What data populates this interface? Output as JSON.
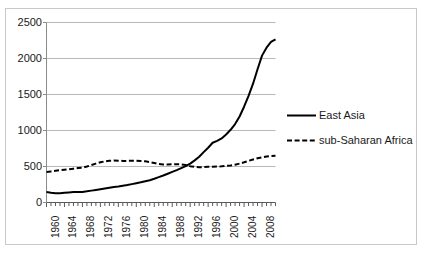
{
  "chart_data": {
    "type": "line",
    "title": "",
    "subtitle": "",
    "xlabel": "",
    "ylabel": "",
    "xlim": [
      1960,
      2011
    ],
    "ylim": [
      0,
      2500
    ],
    "grid": true,
    "grid_axis": "y",
    "legend_position": "right",
    "y_ticks": [
      0,
      500,
      1000,
      1500,
      2000,
      2500
    ],
    "y_tick_labels": [
      "0",
      "500",
      "1000",
      "1500",
      "2000",
      "2500"
    ],
    "x_ticks": [
      1960,
      1964,
      1968,
      1972,
      1976,
      1980,
      1984,
      1988,
      1992,
      1996,
      2000,
      2004,
      2008
    ],
    "x_tick_labels": [
      "1960",
      "1964",
      "1968",
      "1972",
      "1976",
      "1980",
      "1984",
      "1988",
      "1992",
      "1996",
      "2000",
      "2004",
      "2008"
    ],
    "x_minor_ticks_every": 1,
    "x": [
      1960,
      1961,
      1962,
      1963,
      1964,
      1965,
      1966,
      1967,
      1968,
      1969,
      1970,
      1971,
      1972,
      1973,
      1974,
      1975,
      1976,
      1977,
      1978,
      1979,
      1980,
      1981,
      1982,
      1983,
      1984,
      1985,
      1986,
      1987,
      1988,
      1989,
      1990,
      1991,
      1992,
      1993,
      1994,
      1995,
      1996,
      1997,
      1998,
      1999,
      2000,
      2001,
      2002,
      2003,
      2004,
      2005,
      2006,
      2007,
      2008,
      2009,
      2010,
      2011
    ],
    "series": [
      {
        "name": "East Asia",
        "style": "solid",
        "color": "#000000",
        "line_width": 2,
        "values": [
          145,
          135,
          128,
          130,
          135,
          140,
          145,
          145,
          147,
          155,
          165,
          175,
          185,
          195,
          205,
          215,
          222,
          232,
          242,
          255,
          268,
          280,
          295,
          310,
          330,
          352,
          375,
          400,
          425,
          450,
          478,
          505,
          540,
          585,
          635,
          700,
          760,
          830,
          855,
          890,
          945,
          1010,
          1090,
          1195,
          1330,
          1480,
          1650,
          1850,
          2040,
          2150,
          2230,
          2265
        ]
      },
      {
        "name": "sub-Saharan Africa",
        "style": "dashed",
        "color": "#000000",
        "line_width": 2,
        "values": [
          425,
          432,
          440,
          448,
          455,
          462,
          470,
          478,
          482,
          500,
          520,
          540,
          558,
          572,
          580,
          582,
          580,
          578,
          578,
          580,
          580,
          578,
          572,
          562,
          548,
          535,
          528,
          528,
          530,
          532,
          528,
          520,
          505,
          495,
          490,
          492,
          495,
          498,
          500,
          502,
          508,
          515,
          525,
          540,
          558,
          578,
          598,
          615,
          628,
          638,
          645,
          650
        ]
      }
    ]
  },
  "legend": {
    "entries": [
      {
        "label": "East Asia",
        "style": "solid"
      },
      {
        "label": "sub-Saharan Africa",
        "style": "dashed"
      }
    ]
  }
}
